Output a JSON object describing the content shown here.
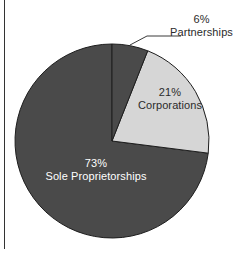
{
  "figure": {
    "background_color": "#ffffff",
    "width": 246,
    "height": 253,
    "left_rule_color": "#333333"
  },
  "chart_data": {
    "type": "pie",
    "title": "",
    "subtitle": "",
    "xlabel": "",
    "ylabel": "",
    "grid": false,
    "legend_position": "none",
    "start_angle_deg": 90,
    "direction": "clockwise",
    "center": {
      "x": 112,
      "y": 141
    },
    "radius": 97,
    "categories": [
      "Partnerships",
      "Corporations",
      "Sole Proprietorships"
    ],
    "values": [
      6,
      21,
      73
    ],
    "value_unit": "%",
    "slices": [
      {
        "label": "Partnerships",
        "value": 6,
        "percent_text": "6%",
        "color": "#4a4a4a",
        "label_color": "#2b2b2b",
        "label_placement": "outside",
        "leader_line": true,
        "start_deg": 0,
        "end_deg": 21.6
      },
      {
        "label": "Corporations",
        "value": 21,
        "percent_text": "21%",
        "color": "#d6d6d6",
        "label_color": "#2b2b2b",
        "label_placement": "inside",
        "leader_line": false,
        "start_deg": 21.6,
        "end_deg": 97.2
      },
      {
        "label": "Sole Proprietorships",
        "value": 73,
        "percent_text": "73%",
        "color": "#4a4a4a",
        "label_color": "#ffffff",
        "label_placement": "inside",
        "leader_line": false,
        "start_deg": 97.2,
        "end_deg": 360
      }
    ],
    "slice_edge_color": "#1e1e1e",
    "leader_line_color": "#3a3a3a"
  },
  "labels": {
    "partnerships": {
      "percent": "6%",
      "name": "Partnerships"
    },
    "corporations": {
      "percent": "21%",
      "name": "Corporations"
    },
    "sole_proprietorships": {
      "percent": "73%",
      "name": "Sole Proprietorships"
    }
  }
}
